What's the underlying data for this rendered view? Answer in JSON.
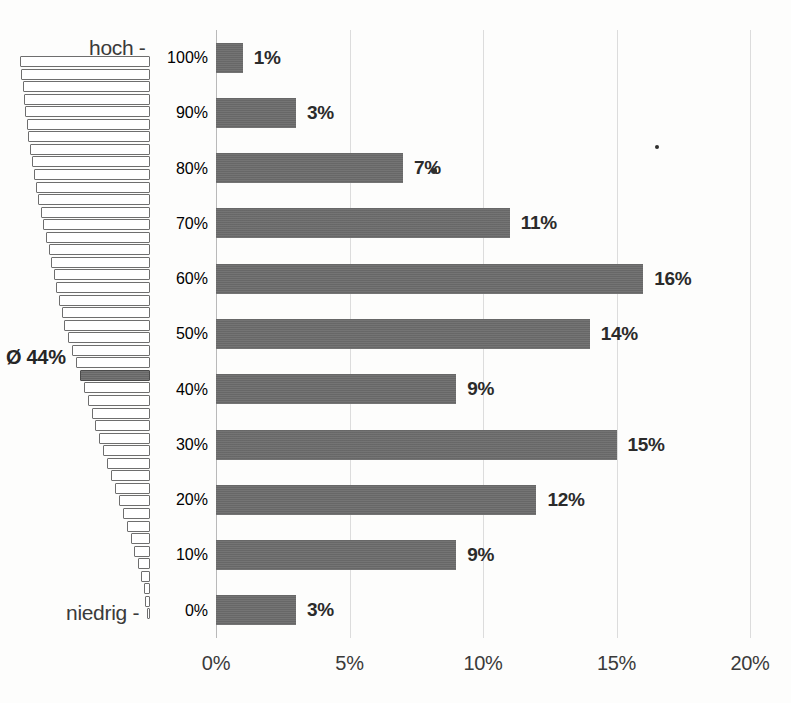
{
  "chart_data": {
    "type": "bar",
    "orientation": "horizontal",
    "title": "",
    "xlabel": "",
    "ylabel": "",
    "xlim": [
      0,
      20
    ],
    "xticks": [
      "0%",
      "5%",
      "10%",
      "15%",
      "20%"
    ],
    "xtick_values": [
      0,
      5,
      10,
      15,
      20
    ],
    "grid": true,
    "categories": [
      "100%",
      "90%",
      "80%",
      "70%",
      "60%",
      "50%",
      "40%",
      "30%",
      "20%",
      "10%",
      "0%"
    ],
    "values": [
      1,
      3,
      7,
      11,
      16,
      14,
      9,
      15,
      12,
      9,
      3
    ],
    "data_labels": [
      "1%",
      "3%",
      "7%",
      "11%",
      "16%",
      "14%",
      "9%",
      "15%",
      "12%",
      "9%",
      "3%"
    ],
    "axis_top_label": "hoch -",
    "axis_bottom_label": "niedrig -",
    "annotations": [
      {
        "text": "Ø 44%",
        "value": 44,
        "description": "mean marker on left pyramid"
      }
    ],
    "bar_color": "#6c6c6c",
    "grid_color": "#dcdcdc",
    "axis_color": "#b9b9b9",
    "text_color": "#3a3a3a"
  },
  "pyramid": {
    "name": "population-pyramid",
    "mean_label": "Ø 44%",
    "widths": [
      100,
      99,
      98,
      97,
      96,
      95,
      94,
      92,
      91,
      89,
      88,
      86,
      84,
      82,
      80,
      78,
      76,
      74,
      72,
      70,
      68,
      66,
      63,
      60,
      57,
      54,
      51,
      48,
      45,
      42,
      39,
      36,
      33,
      30,
      27,
      24,
      21,
      18,
      15,
      12,
      9,
      7,
      5,
      3.5,
      2
    ],
    "mean_index": 25
  },
  "axis": {
    "top_label": "hoch -",
    "bottom_label": "niedrig -",
    "y_labels": [
      "100%",
      "90%",
      "80%",
      "70%",
      "60%",
      "50%",
      "40%",
      "30%",
      "20%",
      "10%",
      "0%"
    ],
    "x_labels": [
      "0%",
      "5%",
      "10%",
      "15%",
      "20%"
    ]
  }
}
